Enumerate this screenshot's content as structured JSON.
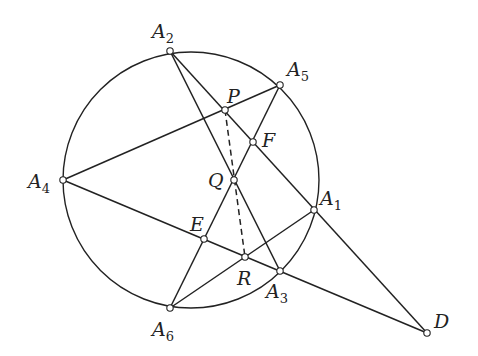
{
  "diagram": {
    "type": "geometry-figure",
    "colors": {
      "stroke": "#222222",
      "point_fill": "#ffffff",
      "background": "#ffffff"
    },
    "circle": {
      "cx": 191,
      "cy": 180,
      "r": 128
    },
    "points": [
      {
        "id": "A1",
        "base": "A",
        "sub": "1",
        "x": 314,
        "y": 210,
        "lx": 320,
        "ly": 205
      },
      {
        "id": "A2",
        "base": "A",
        "sub": "2",
        "x": 170,
        "y": 51,
        "lx": 152,
        "ly": 38
      },
      {
        "id": "A3",
        "base": "A",
        "sub": "3",
        "x": 280,
        "y": 271,
        "lx": 266,
        "ly": 298
      },
      {
        "id": "A4",
        "base": "A",
        "sub": "4",
        "x": 63,
        "y": 180,
        "lx": 28,
        "ly": 188
      },
      {
        "id": "A5",
        "base": "A",
        "sub": "5",
        "x": 280,
        "y": 85,
        "lx": 287,
        "ly": 76
      },
      {
        "id": "A6",
        "base": "A",
        "sub": "6",
        "x": 170,
        "y": 308,
        "lx": 152,
        "ly": 336
      },
      {
        "id": "P",
        "base": "P",
        "sub": "",
        "x": 225,
        "y": 110,
        "lx": 227,
        "ly": 103
      },
      {
        "id": "F",
        "base": "F",
        "sub": "",
        "x": 253,
        "y": 142,
        "lx": 262,
        "ly": 147
      },
      {
        "id": "Q",
        "base": "Q",
        "sub": "",
        "x": 234,
        "y": 180,
        "lx": 208,
        "ly": 187
      },
      {
        "id": "E",
        "base": "E",
        "sub": "",
        "x": 204,
        "y": 239,
        "lx": 190,
        "ly": 231
      },
      {
        "id": "R",
        "base": "R",
        "sub": "",
        "x": 245,
        "y": 257,
        "lx": 237,
        "ly": 285
      },
      {
        "id": "D",
        "base": "D",
        "sub": "",
        "x": 427,
        "y": 333,
        "lx": 434,
        "ly": 328
      }
    ],
    "segments": [
      {
        "from": "A2",
        "to": "D",
        "dashed": false,
        "through": [
          "P",
          "F",
          "A1"
        ]
      },
      {
        "from": "A2",
        "to": "A3",
        "dashed": false,
        "through": [
          "Q"
        ]
      },
      {
        "from": "A4",
        "to": "A5",
        "dashed": false,
        "through": [
          "P"
        ]
      },
      {
        "from": "A5",
        "to": "A6",
        "dashed": false,
        "through": [
          "F",
          "Q",
          "E"
        ]
      },
      {
        "from": "A4",
        "to": "D",
        "dashed": false,
        "through": [
          "E",
          "R",
          "A3"
        ]
      },
      {
        "from": "A6",
        "to": "A1",
        "dashed": false,
        "through": [
          "R"
        ]
      },
      {
        "from": "P",
        "to": "R",
        "dashed": true,
        "through": [
          "Q"
        ]
      }
    ]
  }
}
